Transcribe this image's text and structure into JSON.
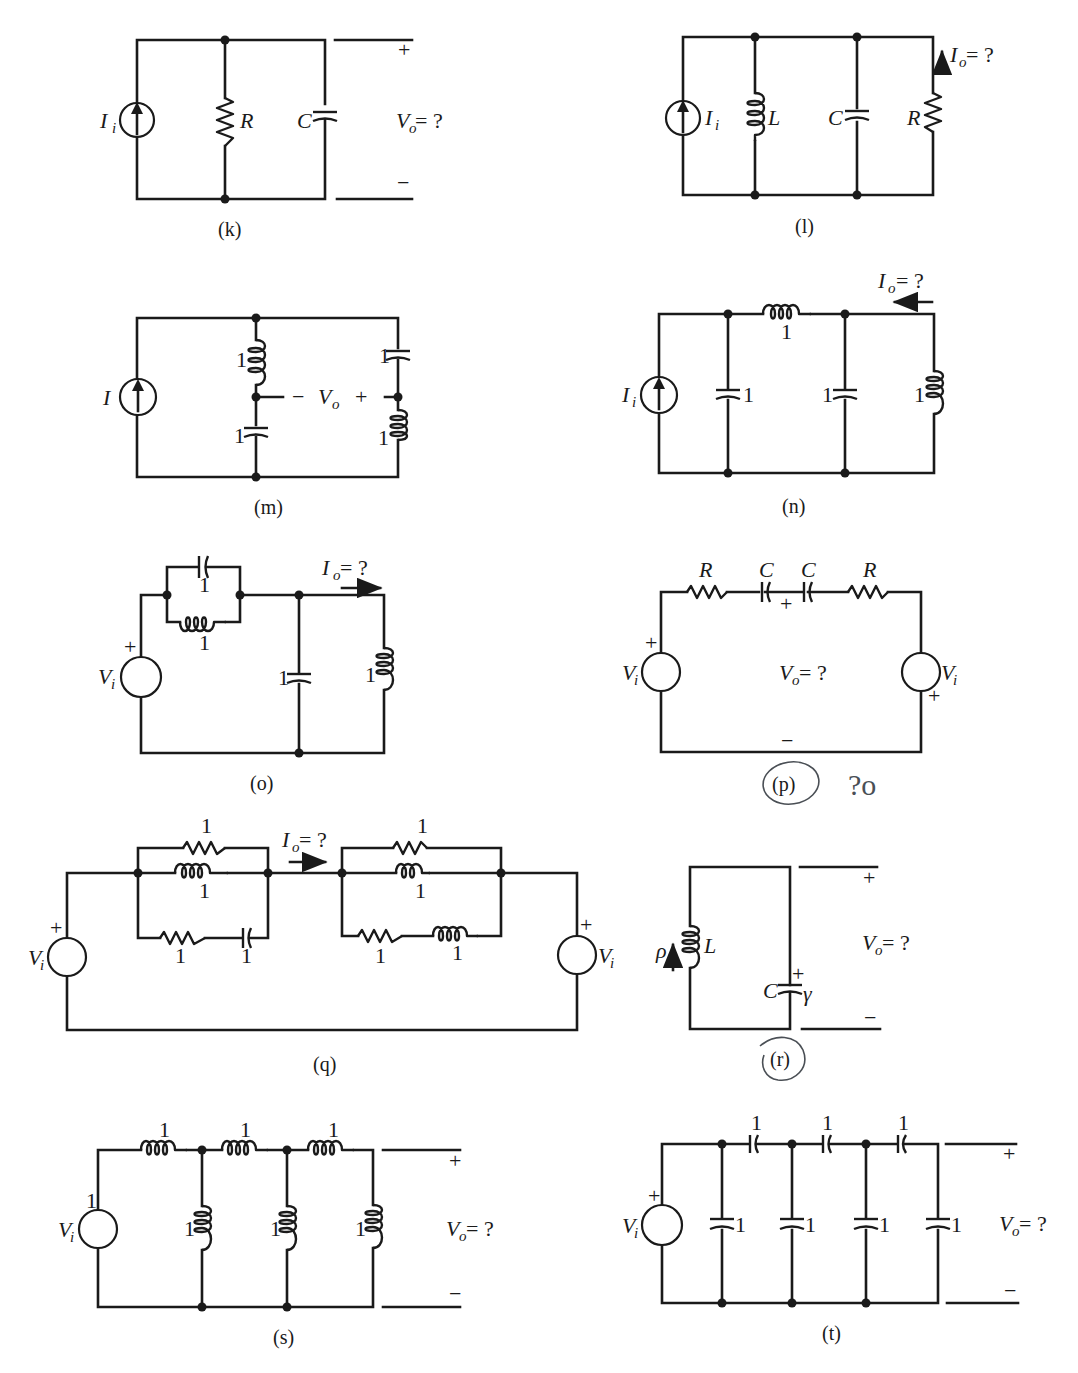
{
  "page": {
    "ink_color": "#1a1a1a",
    "annotation_color": "#4a4f55"
  },
  "circuits": {
    "k": {
      "caption": "(k)",
      "source": {
        "type": "current",
        "label": "I",
        "sub": "i"
      },
      "components": [
        {
          "type": "resistor",
          "label": "R"
        },
        {
          "type": "capacitor",
          "label": "C"
        }
      ],
      "output": {
        "label": "V",
        "sub": "o",
        "suffix": " = ?",
        "plus": "+",
        "minus": "−"
      }
    },
    "l": {
      "caption": "(l)",
      "source": {
        "type": "current",
        "label": "I",
        "sub": "i"
      },
      "components": [
        {
          "type": "inductor",
          "label": "L"
        },
        {
          "type": "capacitor",
          "label": "C"
        },
        {
          "type": "resistor",
          "label": "R"
        }
      ],
      "output": {
        "label": "I",
        "sub": "o",
        "suffix": " = ?",
        "direction": "up"
      }
    },
    "m": {
      "caption": "(m)",
      "source": {
        "type": "current",
        "label": "I"
      },
      "components": [
        {
          "type": "inductor",
          "label": "1"
        },
        {
          "type": "capacitor",
          "label": "1"
        },
        {
          "type": "capacitor",
          "label": "1"
        },
        {
          "type": "inductor",
          "label": "1"
        }
      ],
      "output": {
        "minus": "−",
        "label": "V",
        "sub": "o",
        "plus": "+"
      }
    },
    "n": {
      "caption": "(n)",
      "source": {
        "type": "current",
        "label": "I",
        "sub": "i"
      },
      "components": [
        {
          "type": "capacitor",
          "label": "1"
        },
        {
          "type": "inductor",
          "label": "1"
        },
        {
          "type": "capacitor",
          "label": "1"
        },
        {
          "type": "inductor",
          "label": "1"
        }
      ],
      "output": {
        "label": "I",
        "sub": "o",
        "suffix": " = ?",
        "direction": "left"
      }
    },
    "o": {
      "caption": "(o)",
      "source": {
        "type": "voltage",
        "label": "V",
        "sub": "i",
        "plus": "+"
      },
      "components": [
        {
          "type": "capacitor",
          "label": "1"
        },
        {
          "type": "inductor",
          "label": "1"
        },
        {
          "type": "capacitor",
          "label": "1"
        },
        {
          "type": "inductor",
          "label": "1"
        }
      ],
      "output": {
        "label": "I",
        "sub": "o",
        "suffix": " = ?",
        "direction": "right"
      }
    },
    "p": {
      "caption": "(p)",
      "source_left": {
        "type": "voltage",
        "label": "V",
        "sub": "i",
        "plus": "+"
      },
      "source_right": {
        "type": "voltage",
        "label": "V",
        "sub": "i",
        "plus": "+"
      },
      "components": [
        {
          "type": "resistor",
          "label": "R"
        },
        {
          "type": "capacitor",
          "label": "C"
        },
        {
          "type": "capacitor",
          "label": "C"
        },
        {
          "type": "resistor",
          "label": "R"
        }
      ],
      "output": {
        "label": "V",
        "sub": "o",
        "suffix": " = ?",
        "plus": "+",
        "minus": "−"
      },
      "handwritten_note": "?o"
    },
    "q": {
      "caption": "(q)",
      "source_left": {
        "type": "voltage",
        "label": "V",
        "sub": "i",
        "plus": "+"
      },
      "source_right": {
        "type": "voltage",
        "label": "V",
        "sub": "i",
        "plus": "+"
      },
      "left_block": [
        {
          "type": "resistor",
          "label": "1"
        },
        {
          "type": "inductor",
          "label": "1"
        },
        {
          "type": "resistor",
          "label": "1"
        },
        {
          "type": "capacitor",
          "label": "1"
        }
      ],
      "right_block": [
        {
          "type": "resistor",
          "label": "1"
        },
        {
          "type": "inductor",
          "label": "1"
        },
        {
          "type": "resistor",
          "label": "1"
        },
        {
          "type": "inductor",
          "label": "1"
        }
      ],
      "output": {
        "label": "I",
        "sub": "o",
        "suffix": " = ?",
        "direction": "right"
      }
    },
    "r": {
      "caption": "(r)",
      "components": [
        {
          "type": "inductor",
          "label": "L",
          "initial": "ρ"
        },
        {
          "type": "capacitor",
          "label": "C",
          "initial": "γ",
          "plus": "+"
        }
      ],
      "output": {
        "label": "V",
        "sub": "o",
        "suffix": " = ?",
        "plus": "+",
        "minus": "−"
      }
    },
    "s": {
      "caption": "(s)",
      "source": {
        "type": "voltage",
        "label": "V",
        "sub": "i",
        "value": "1"
      },
      "components": [
        {
          "type": "inductor",
          "label": "1"
        },
        {
          "type": "inductor",
          "label": "1"
        },
        {
          "type": "inductor",
          "label": "1"
        },
        {
          "type": "inductor",
          "label": "1"
        },
        {
          "type": "inductor",
          "label": "1"
        },
        {
          "type": "inductor",
          "label": "1"
        }
      ],
      "output": {
        "label": "V",
        "sub": "o",
        "suffix": " = ?",
        "plus": "+",
        "minus": "−"
      }
    },
    "t": {
      "caption": "(t)",
      "source": {
        "type": "voltage",
        "label": "V",
        "sub": "i",
        "plus": "+"
      },
      "components": [
        {
          "type": "capacitor",
          "label": "1"
        },
        {
          "type": "capacitor",
          "label": "1"
        },
        {
          "type": "capacitor",
          "label": "1"
        },
        {
          "type": "capacitor",
          "label": "1"
        },
        {
          "type": "capacitor",
          "label": "1"
        },
        {
          "type": "capacitor",
          "label": "1"
        },
        {
          "type": "capacitor",
          "label": "1"
        }
      ],
      "output": {
        "label": "V",
        "sub": "o",
        "suffix": " = ?",
        "plus": "+",
        "minus": "−"
      }
    }
  }
}
